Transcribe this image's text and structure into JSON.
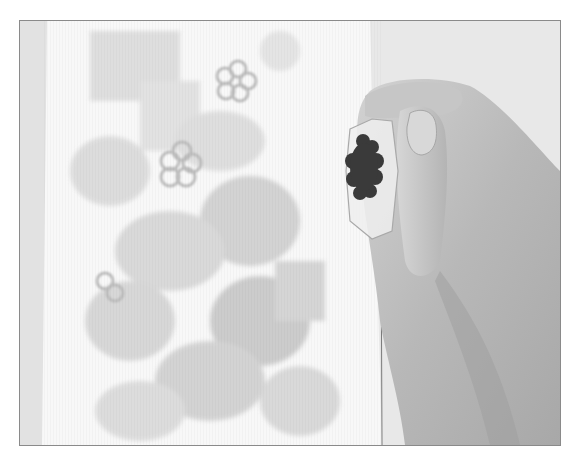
{
  "image": {
    "kind": "photograph",
    "tone": "grayscale",
    "subject": "hand holding clear acrylic stamp block with dark flower stamp over watercolor-stamped card",
    "elements": [
      {
        "name": "background-surface",
        "color": "#e6e6e6"
      },
      {
        "name": "card",
        "color": "#f7f7f7"
      },
      {
        "name": "stamped-flowers",
        "color": "#cfcfcf"
      },
      {
        "name": "hand",
        "color": "#bdbdbd"
      },
      {
        "name": "stamp-block",
        "color": "#e9e9e9"
      },
      {
        "name": "rubber-stamp-flower",
        "color": "#3a3a3a"
      }
    ],
    "frame_border_color": "#8a8a8a"
  }
}
